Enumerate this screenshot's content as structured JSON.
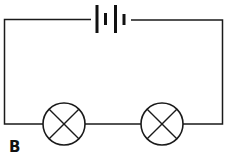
{
  "diagram": {
    "type": "series circuit",
    "label": "B",
    "components": [
      {
        "kind": "battery",
        "cells": 2,
        "position": "top-center"
      },
      {
        "kind": "lamp",
        "symbol": "circle-with-cross",
        "position": "bottom-left"
      },
      {
        "kind": "lamp",
        "symbol": "circle-with-cross",
        "position": "bottom-right"
      }
    ],
    "colors": {
      "line": "#1a1a1a",
      "background": "#ffffff"
    }
  }
}
